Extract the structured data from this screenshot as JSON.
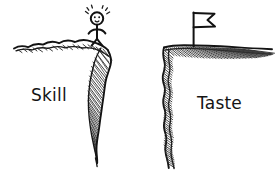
{
  "illustration": {
    "title": "Skill and Taste cliffs sketch",
    "style": "hand-drawn pen sketch",
    "background_color": "#ffffff",
    "ink_color": "#1a1a1a"
  },
  "labels": {
    "left": "Skill",
    "right": "Taste"
  },
  "left_scene": {
    "name": "skill-cliff",
    "label": "Skill",
    "figure": {
      "name": "stick-figure",
      "description": "excited stick figure standing at cliff edge",
      "has_face": true,
      "excitement_marks": 5
    }
  },
  "right_scene": {
    "name": "taste-cliff",
    "label": "Taste",
    "flag": {
      "name": "flag",
      "description": "pennant flag planted on plateau",
      "shape": "swallowtail"
    }
  }
}
